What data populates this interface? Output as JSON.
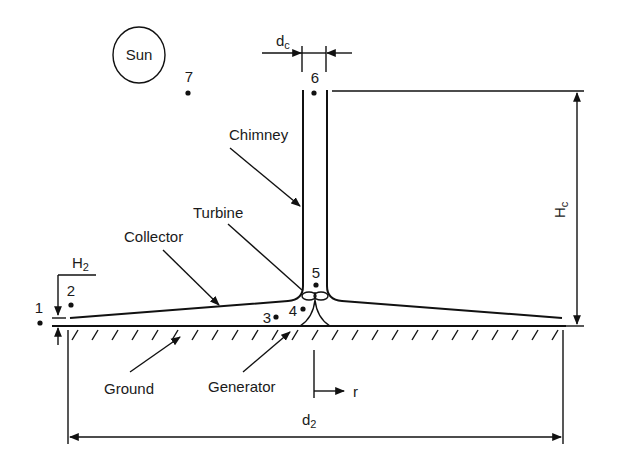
{
  "diagram": {
    "type": "solar-chimney-power-plant-schematic",
    "components": {
      "sun": "Sun",
      "chimney": "Chimney",
      "turbine": "Turbine",
      "collector": "Collector",
      "ground": "Ground",
      "generator": "Generator"
    },
    "dimensions": {
      "chimney_diameter": {
        "base": "d",
        "sub": "c"
      },
      "chimney_height": {
        "base": "H",
        "sub": "c"
      },
      "collector_height": {
        "base": "H",
        "sub": "2"
      },
      "collector_diameter": {
        "base": "d",
        "sub": "2"
      }
    },
    "points": [
      "1",
      "2",
      "3",
      "4",
      "5",
      "6",
      "7"
    ],
    "axis": {
      "radial": "r"
    },
    "colors": {
      "line": "#111111",
      "background": "#ffffff"
    }
  }
}
